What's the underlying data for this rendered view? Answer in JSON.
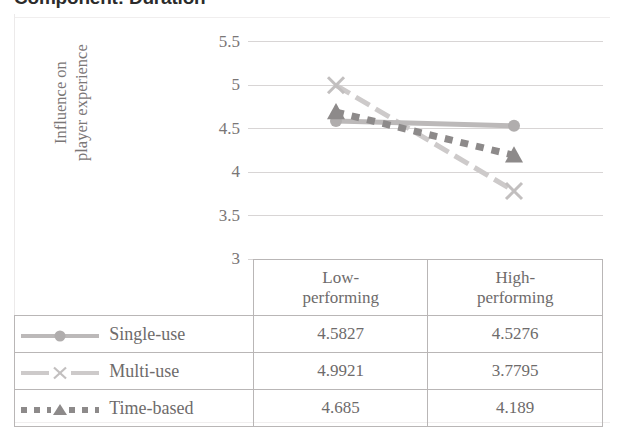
{
  "chart_title": "Component: Duration",
  "axis": {
    "y_title_line1": "Influence on",
    "y_title_line2": "player experience",
    "y_ticks": [
      "5.5",
      "5",
      "4.5",
      "4",
      "3.5",
      "3"
    ]
  },
  "table": {
    "headers": {
      "corner": "",
      "col1_line1": "Low-",
      "col1_line2": "performing",
      "col2_line1": "High-",
      "col2_line2": "performing"
    },
    "rows": [
      {
        "label": "Single-use",
        "low": "4.5827",
        "high": "4.5276"
      },
      {
        "label": "Multi-use",
        "low": "4.9921",
        "high": "3.7795"
      },
      {
        "label": "Time-based",
        "low": "4.685",
        "high": "4.189"
      }
    ]
  },
  "colors": {
    "single_use": "#b3b0b0",
    "multi_use": "#c9c6c6",
    "time_based": "#8d8a8a",
    "gridline": "#d8d5d5",
    "text": "#6e6b6b",
    "title": "#2b2b2b"
  },
  "chart_data": {
    "type": "line",
    "title": "Component: Duration",
    "xlabel": "",
    "ylabel": "Influence on player experience",
    "ylim": [
      3,
      5.5
    ],
    "yticks": [
      3,
      3.5,
      4,
      4.5,
      5,
      5.5
    ],
    "grid": true,
    "legend_position": "table-below",
    "categories": [
      "Low-performing",
      "High-performing"
    ],
    "series": [
      {
        "name": "Single-use",
        "marker": "circle",
        "values": [
          4.5827,
          4.5276
        ]
      },
      {
        "name": "Multi-use",
        "marker": "x",
        "values": [
          4.9921,
          3.7795
        ]
      },
      {
        "name": "Time-based",
        "marker": "triangle",
        "values": [
          4.685,
          4.189
        ]
      }
    ]
  }
}
